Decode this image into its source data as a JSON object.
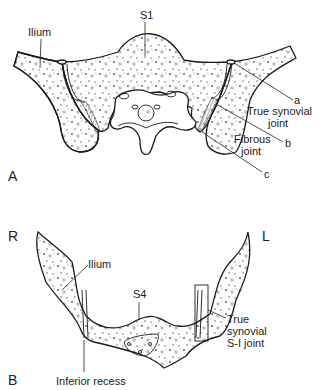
{
  "figure": {
    "panel_a": {
      "panel_label": "A",
      "labels": {
        "sacrum_level": "S1",
        "ilium": "Ilium",
        "letter_a": "a",
        "true_synovial_line1": "True synovial",
        "true_synovial_line2": "joint",
        "letter_b": "b",
        "fibrous_line1": "Fibrous",
        "fibrous_line2": "joint",
        "letter_c": "c"
      }
    },
    "panel_b": {
      "panel_label": "B",
      "labels": {
        "right": "R",
        "left": "L",
        "ilium": "Ilium",
        "sacrum_level": "S4",
        "true_synovial_line1": "True",
        "true_synovial_line2": "synovial",
        "true_synovial_line3": "S-I joint",
        "inferior_recess": "Inferior recess"
      }
    }
  }
}
